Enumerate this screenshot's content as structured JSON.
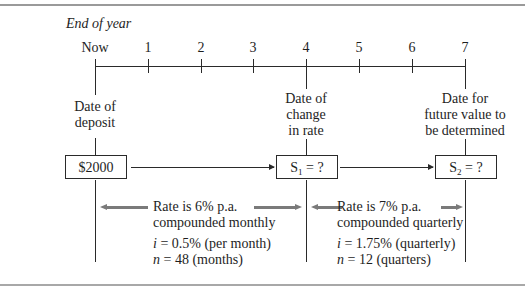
{
  "heading": "End of year",
  "timeline": {
    "ticks": [
      "Now",
      "1",
      "2",
      "3",
      "4",
      "5",
      "6",
      "7"
    ]
  },
  "captions": {
    "deposit": [
      "Date of",
      "deposit"
    ],
    "change": [
      "Date of",
      "change",
      "in rate"
    ],
    "future": [
      "Date for",
      "future value to",
      "be determined"
    ]
  },
  "boxes": {
    "deposit": "$2000",
    "s1": {
      "symbol": "S",
      "sub": "1",
      "rest": " = ?"
    },
    "s2": {
      "symbol": "S",
      "sub": "2",
      "rest": " = ?"
    }
  },
  "period1": {
    "rate_line1": "Rate is 6% p.a.",
    "rate_line2": "compounded monthly",
    "i_var": "i",
    "i_value": " = 0.5% (per month)",
    "n_var": "n",
    "n_value": " = 48 (months)"
  },
  "period2": {
    "rate_line1": "Rate is 7% p.a.",
    "rate_line2": "compounded quarterly",
    "i_var": "i",
    "i_value": " = 1.75% (quarterly)",
    "n_var": "n",
    "n_value": " = 12 (quarters)"
  },
  "colors": {
    "line": "#2a2a2a",
    "rate_arrow": "#7a7a7a",
    "border": "#9a9a9a"
  }
}
